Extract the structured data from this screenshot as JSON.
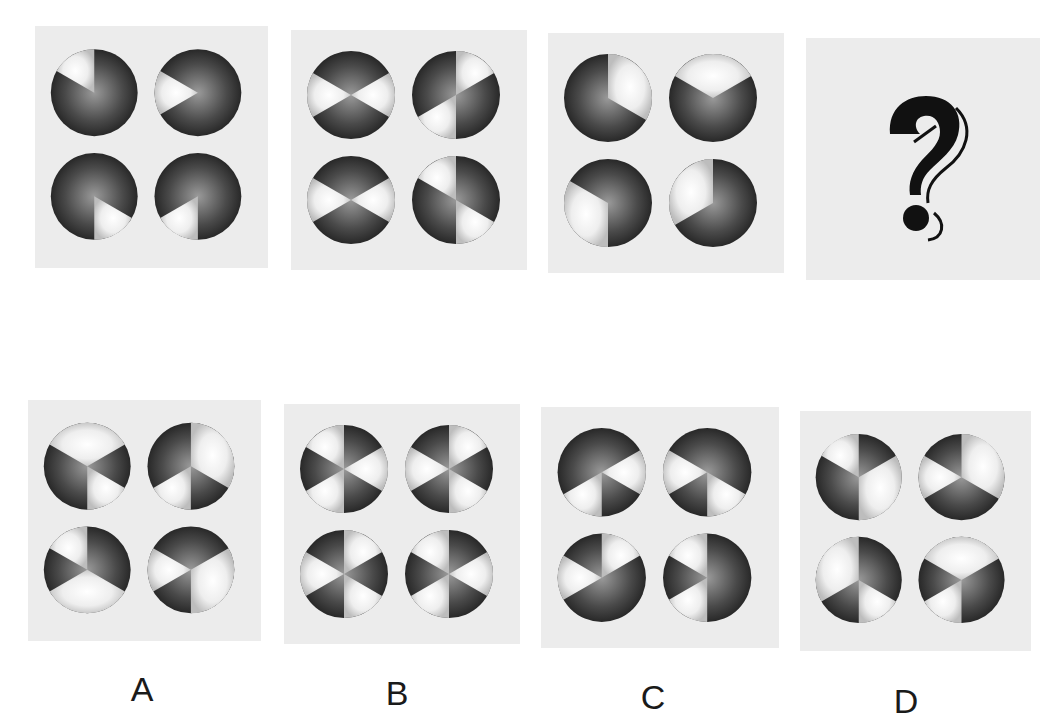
{
  "puzzle": {
    "type": "figure-reasoning",
    "question_row": [
      {
        "id": "q1",
        "circles": [
          {
            "light_sectors": [
              [
                300,
                360
              ]
            ]
          },
          {
            "light_sectors": [
              [
                240,
                300
              ]
            ]
          },
          {
            "light_sectors": [
              [
                120,
                180
              ]
            ]
          },
          {
            "light_sectors": [
              [
                180,
                240
              ]
            ]
          }
        ]
      },
      {
        "id": "q2",
        "circles": [
          {
            "light_sectors": [
              [
                60,
                120
              ],
              [
                240,
                300
              ]
            ]
          },
          {
            "light_sectors": [
              [
                0,
                60
              ],
              [
                180,
                240
              ]
            ]
          },
          {
            "light_sectors": [
              [
                60,
                120
              ],
              [
                240,
                300
              ]
            ]
          },
          {
            "light_sectors": [
              [
                300,
                360
              ],
              [
                120,
                180
              ]
            ]
          }
        ]
      },
      {
        "id": "q3",
        "circles": [
          {
            "light_sectors": [
              [
                0,
                120
              ]
            ]
          },
          {
            "light_sectors": [
              [
                300,
                420
              ]
            ]
          },
          {
            "light_sectors": [
              [
                180,
                300
              ]
            ]
          },
          {
            "light_sectors": [
              [
                240,
                360
              ]
            ]
          }
        ]
      },
      {
        "id": "q4",
        "is_unknown": true,
        "symbol": "?"
      }
    ],
    "options": [
      {
        "label": "A",
        "circles": [
          {
            "light_sectors": [
              [
                300,
                60
              ],
              [
                120,
                180
              ]
            ]
          },
          {
            "light_sectors": [
              [
                0,
                120
              ],
              [
                180,
                240
              ]
            ]
          },
          {
            "light_sectors": [
              [
                300,
                360
              ],
              [
                120,
                240
              ]
            ]
          },
          {
            "light_sectors": [
              [
                60,
                180
              ],
              [
                240,
                300
              ]
            ]
          }
        ]
      },
      {
        "label": "B",
        "circles": [
          {
            "light_sectors": [
              [
                300,
                360
              ],
              [
                60,
                120
              ],
              [
                180,
                240
              ]
            ]
          },
          {
            "light_sectors": [
              [
                0,
                60
              ],
              [
                120,
                180
              ],
              [
                240,
                300
              ]
            ]
          },
          {
            "light_sectors": [
              [
                0,
                60
              ],
              [
                120,
                180
              ],
              [
                240,
                300
              ]
            ]
          },
          {
            "light_sectors": [
              [
                300,
                360
              ],
              [
                60,
                120
              ],
              [
                180,
                240
              ]
            ]
          }
        ]
      },
      {
        "label": "C",
        "circles": [
          {
            "light_sectors": [
              [
                60,
                120
              ],
              [
                180,
                240
              ]
            ]
          },
          {
            "light_sectors": [
              [
                240,
                300
              ],
              [
                120,
                180
              ]
            ]
          },
          {
            "light_sectors": [
              [
                0,
                60
              ],
              [
                240,
                300
              ]
            ]
          },
          {
            "light_sectors": [
              [
                300,
                360
              ],
              [
                180,
                240
              ]
            ]
          }
        ]
      },
      {
        "label": "D",
        "circles": [
          {
            "light_sectors": [
              [
                300,
                360
              ],
              [
                60,
                180
              ]
            ]
          },
          {
            "light_sectors": [
              [
                0,
                120
              ],
              [
                240,
                300
              ]
            ]
          },
          {
            "light_sectors": [
              [
                240,
                360
              ],
              [
                120,
                180
              ]
            ]
          },
          {
            "light_sectors": [
              [
                300,
                60
              ],
              [
                180,
                240
              ]
            ]
          }
        ]
      }
    ]
  },
  "labels": {
    "a": "A",
    "b": "B",
    "c": "C",
    "d": "D"
  },
  "colors": {
    "panel_bg": "#ececec",
    "dark_sector": "#3a3a3a",
    "light_sector": "#f4f4f4",
    "question_mark": "#111111"
  }
}
